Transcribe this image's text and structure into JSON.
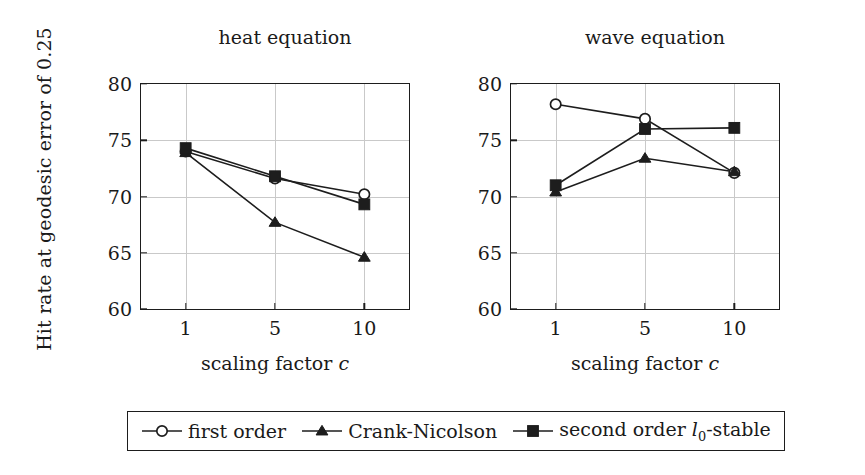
{
  "figure": {
    "ylabel": "Hit rate at geodesic error of 0.25",
    "legend_border_color": "#1d1d1d",
    "axis_color": "#1d1d1d",
    "grid_color": "#c9c9c9",
    "series_color": "#1d1d1d"
  },
  "legend": {
    "entries": [
      {
        "label": "first order",
        "marker": "open-circle-marker"
      },
      {
        "label": "Crank-Nicolson",
        "marker": "filled-triangle-marker"
      },
      {
        "label": "second order l0-stable",
        "marker": "filled-square-marker"
      }
    ]
  },
  "chart_data": [
    {
      "type": "line",
      "title": "heat equation",
      "xlabel": "scaling factor c",
      "ylabel": "Hit rate at geodesic error of 0.25",
      "categories": [
        "1",
        "5",
        "10"
      ],
      "x": [
        1,
        5,
        10
      ],
      "xticklabels": [
        "1",
        "5",
        "10"
      ],
      "yticklabels": [
        "60",
        "65",
        "70",
        "75",
        "80"
      ],
      "yticks": [
        60,
        65,
        70,
        75,
        80
      ],
      "ylim": [
        60,
        80
      ],
      "grid": true,
      "legend_position": "below-figure",
      "series": [
        {
          "name": "first order",
          "marker": "open-circle",
          "values": [
            74.0,
            71.6,
            70.2
          ]
        },
        {
          "name": "Crank-Nicolson",
          "marker": "filled-triangle",
          "values": [
            73.9,
            67.7,
            64.6
          ]
        },
        {
          "name": "second order l0-stable",
          "marker": "filled-square",
          "values": [
            74.3,
            71.8,
            69.3
          ]
        }
      ]
    },
    {
      "type": "line",
      "title": "wave equation",
      "xlabel": "scaling factor c",
      "ylabel": "Hit rate at geodesic error of 0.25",
      "categories": [
        "1",
        "5",
        "10"
      ],
      "x": [
        1,
        5,
        10
      ],
      "xticklabels": [
        "1",
        "5",
        "10"
      ],
      "yticklabels": [
        "60",
        "65",
        "70",
        "75",
        "80"
      ],
      "yticks": [
        60,
        65,
        70,
        75,
        80
      ],
      "ylim": [
        60,
        80
      ],
      "grid": true,
      "legend_position": "below-figure",
      "series": [
        {
          "name": "first order",
          "marker": "open-circle",
          "values": [
            78.2,
            76.9,
            72.1
          ]
        },
        {
          "name": "Crank-Nicolson",
          "marker": "filled-triangle",
          "values": [
            70.4,
            73.4,
            72.2
          ]
        },
        {
          "name": "second order l0-stable",
          "marker": "filled-square",
          "values": [
            71.0,
            76.0,
            76.1
          ]
        }
      ]
    }
  ]
}
